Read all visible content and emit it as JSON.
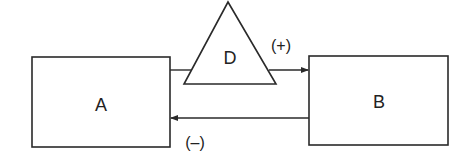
{
  "diagram": {
    "type": "block-diagram",
    "nodes": [
      {
        "id": "A",
        "label": "A",
        "shape": "rectangle"
      },
      {
        "id": "B",
        "label": "B",
        "shape": "rectangle"
      },
      {
        "id": "D",
        "label": "D",
        "shape": "triangle"
      }
    ],
    "edges": [
      {
        "from": "A",
        "to": "B",
        "via": "D",
        "label": "(+)",
        "direction": "right"
      },
      {
        "from": "B",
        "to": "A",
        "label": "(–)",
        "direction": "left"
      }
    ],
    "colors": {
      "stroke": "#2a2a2a",
      "background": "#ffffff"
    }
  }
}
